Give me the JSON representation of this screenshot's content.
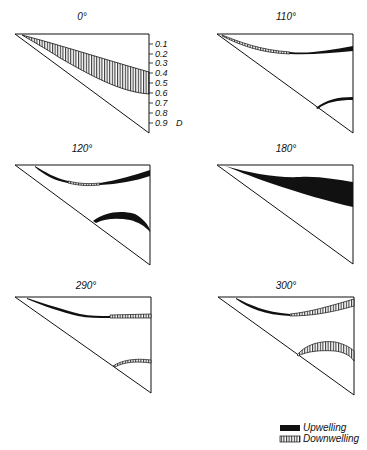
{
  "figure": {
    "panels": [
      {
        "title": "0°"
      },
      {
        "title": "110°"
      },
      {
        "title": "120°"
      },
      {
        "title": "180°"
      },
      {
        "title": "290°"
      },
      {
        "title": "300°"
      }
    ],
    "axis": {
      "label": "D",
      "ticks": [
        "0.1",
        "0.2",
        "0.3",
        "0.4",
        "0.5",
        "0.6",
        "0.7",
        "0.8",
        "0.9"
      ]
    },
    "legend": {
      "items": [
        {
          "label": "Upwelling",
          "style": "solid-black"
        },
        {
          "label": "Downwelling",
          "style": "vertical-hatch"
        }
      ]
    },
    "colors": {
      "ink": "#111111",
      "background": "#ffffff"
    }
  }
}
